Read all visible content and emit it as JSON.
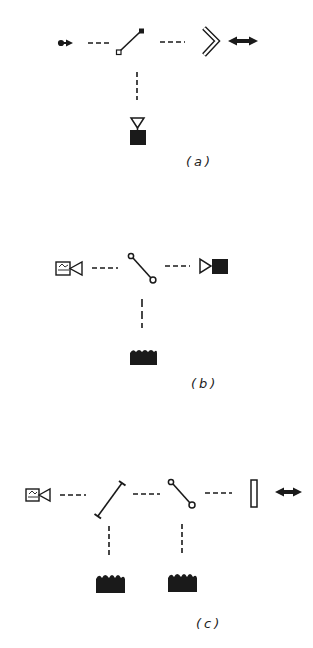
{
  "figure": {
    "panels": [
      {
        "id": "a",
        "label": "(a)",
        "elements": [
          "source-arrow-icon",
          "dashed-line",
          "mirror-square-ends-icon",
          "dashed-line",
          "chevron-reflector-icon",
          "double-arrow-icon",
          "vertical-dashed-line",
          "detector-icon"
        ]
      },
      {
        "id": "b",
        "label": "(b)",
        "elements": [
          "camera-icon",
          "dashed-line",
          "switch-circle-ends-icon",
          "dashed-line",
          "detector-sideways-icon",
          "vertical-dashed-line",
          "film-block-icon"
        ]
      },
      {
        "id": "c",
        "label": "(c)",
        "elements": [
          "camera-icon",
          "dashed-line",
          "mirror-bar-ends-icon",
          "dashed-line",
          "switch-circle-ends-icon",
          "dashed-line",
          "rectangle-window-icon",
          "double-arrow-icon",
          "vertical-dashed-line",
          "film-block-icon",
          "vertical-dashed-line",
          "film-block-icon"
        ]
      }
    ],
    "colors": {
      "ink": "#1a1a1a",
      "background": "#ffffff"
    }
  }
}
